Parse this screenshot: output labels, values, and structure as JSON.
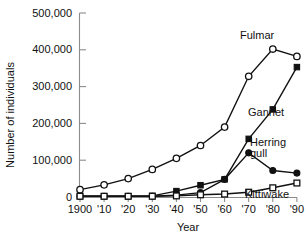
{
  "chart_data": {
    "type": "line",
    "title": "",
    "xlabel": "Year",
    "ylabel": "Number of individuals",
    "categories": [
      "1900",
      "'10",
      "'20",
      "'30",
      "'40",
      "'50",
      "'60",
      "'70",
      "'80",
      "'90"
    ],
    "x_values": [
      1900,
      1910,
      1920,
      1930,
      1940,
      1950,
      1960,
      1970,
      1980,
      1990
    ],
    "ylim": [
      0,
      500000
    ],
    "yticks": [
      0,
      100000,
      200000,
      300000,
      400000,
      500000
    ],
    "ytick_labels": [
      "0",
      "100,000",
      "200,000",
      "300,000",
      "400,000",
      "500,000"
    ],
    "grid": false,
    "legend_position": "inline-right-annotations",
    "series": [
      {
        "name": "Fulmar",
        "marker": "open-circle",
        "values": [
          20000,
          33000,
          50000,
          75000,
          105000,
          140000,
          190000,
          328000,
          402000,
          382000
        ]
      },
      {
        "name": "Gannet",
        "marker": "filled-square",
        "values": [
          2000,
          2000,
          2000,
          3000,
          16000,
          32000,
          48000,
          158000,
          238000,
          353000
        ]
      },
      {
        "name": "Herring gull",
        "marker": "filled-circle",
        "values": [
          2000,
          2000,
          2000,
          2000,
          5000,
          12000,
          48000,
          120000,
          72000,
          65000
        ]
      },
      {
        "name": "Kittiwake",
        "marker": "open-square",
        "values": [
          2000,
          2000,
          2000,
          2000,
          3000,
          6000,
          8000,
          13000,
          25000,
          38000
        ]
      }
    ],
    "annotations": [
      {
        "text": "Fulmar",
        "series": "Fulmar"
      },
      {
        "text": "Gannet",
        "series": "Gannet"
      },
      {
        "text": "Herring",
        "series": "Herring gull"
      },
      {
        "text": "gull",
        "series": "Herring gull"
      },
      {
        "text": "Kittiwake",
        "series": "Kittiwake"
      }
    ]
  }
}
